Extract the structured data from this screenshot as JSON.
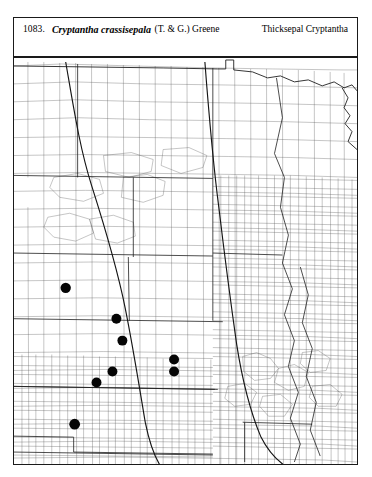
{
  "header": {
    "record_number": "1083.",
    "scientific_name": "Cryptantha crassisepala",
    "authority": "(T. & G.) Greene",
    "common_name": "Thicksepal Cryptantha"
  },
  "map": {
    "title": "Distribution map of Cryptantha crassisepala",
    "region": "Great Plains / North-Central United States",
    "frame": {
      "x": 13,
      "y": 57,
      "width": 345,
      "height": 408
    },
    "symbol_legend": "filled circle = county occurrence record",
    "colors": {
      "county_line": "#5a5a5a",
      "state_line": "#1f1f1f",
      "range_line": "#141414",
      "dot_fill": "#050505",
      "background": "#ffffff"
    },
    "occurrence_dots": [
      {
        "id": "dot-1",
        "x": 65,
        "y": 288,
        "r": 5.2
      },
      {
        "id": "dot-2",
        "x": 116,
        "y": 319,
        "r": 5.0
      },
      {
        "id": "dot-3",
        "x": 122,
        "y": 341,
        "r": 5.0
      },
      {
        "id": "dot-4",
        "x": 174,
        "y": 360,
        "r": 5.0
      },
      {
        "id": "dot-5",
        "x": 174,
        "y": 372,
        "r": 5.0
      },
      {
        "id": "dot-6",
        "x": 112,
        "y": 372,
        "r": 5.0
      },
      {
        "id": "dot-7",
        "x": 96,
        "y": 383,
        "r": 5.0
      },
      {
        "id": "dot-8",
        "x": 74,
        "y": 425,
        "r": 5.4
      }
    ],
    "dot_count": 8,
    "range_boundaries": [
      {
        "id": "western-range-line",
        "description": "western arc running north-south through the western plains"
      },
      {
        "id": "eastern-range-line",
        "description": "eastern arc curving south-east across the central plains"
      }
    ]
  }
}
